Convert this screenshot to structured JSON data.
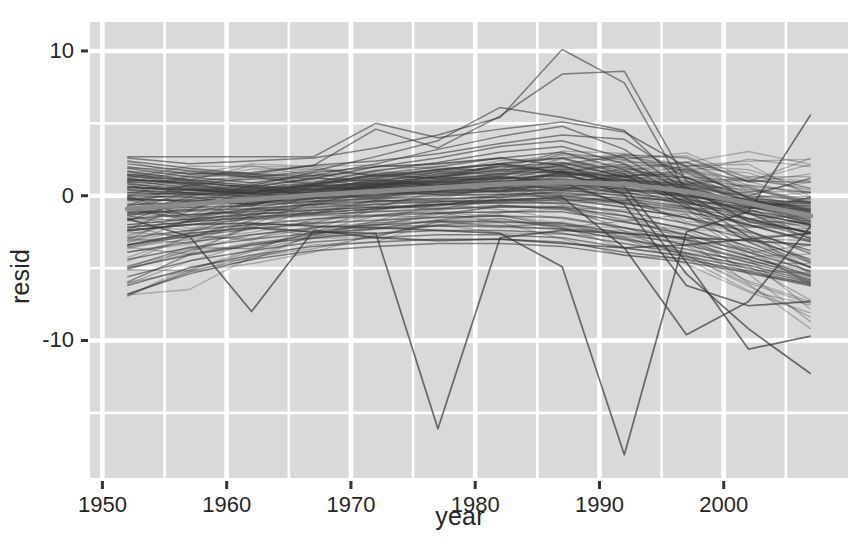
{
  "chart_data": {
    "type": "line",
    "title": "",
    "subtitle": "",
    "xlabel": "year",
    "ylabel": "resid",
    "xlim": [
      1949.0,
      2010.0
    ],
    "ylim": [
      -19.5,
      12.0
    ],
    "xticks": [
      1950,
      1960,
      1970,
      1980,
      1990,
      2000
    ],
    "xtick_labels": [
      "1950",
      "1960",
      "1970",
      "1980",
      "1990",
      "2000"
    ],
    "yticks": [
      10,
      0,
      -10
    ],
    "ytick_labels": [
      "10",
      "0",
      "-10"
    ],
    "minor_yticks": [
      5,
      -5,
      -15
    ],
    "minor_xticks": [
      1955,
      1965,
      1975,
      1985,
      1995,
      2005
    ],
    "grid": true,
    "grid_color": "#ffffff",
    "panel_background": "#d9d9d9",
    "legend_position": "none",
    "line_color": "#3a3a3a",
    "smooth_line_color": "#8c8c8c",
    "x_sample_years": [
      1952,
      1957,
      1962,
      1967,
      1972,
      1977,
      1982,
      1987,
      1992,
      1997,
      2002,
      2007
    ],
    "n_series": 142,
    "series": [
      {
        "name": "loess-smooth",
        "is_smooth": true,
        "values": [
          -0.9,
          -0.6,
          -0.25,
          0.05,
          0.3,
          0.55,
          0.8,
          0.95,
          0.8,
          0.3,
          -0.5,
          -1.4
        ]
      },
      {
        "name": "s1",
        "values": [
          2.7,
          2.7,
          2.7,
          2.7,
          5.0,
          4.0,
          4.6,
          5.1,
          4.4,
          2.0,
          -0.2,
          -1.4
        ]
      },
      {
        "name": "s2",
        "values": [
          2.6,
          2.2,
          2.4,
          2.6,
          3.3,
          4.2,
          5.4,
          10.1,
          7.8,
          0.2,
          -1.2,
          -2.0
        ]
      },
      {
        "name": "s3",
        "values": [
          2.4,
          1.9,
          1.5,
          2.1,
          4.6,
          3.3,
          5.5,
          8.4,
          8.6,
          1.0,
          -0.4,
          -1.1
        ]
      },
      {
        "name": "s4",
        "values": [
          2.2,
          1.7,
          1.3,
          1.7,
          2.7,
          3.8,
          6.1,
          5.4,
          4.5,
          0.6,
          -1.8,
          -2.5
        ]
      },
      {
        "name": "s5",
        "values": [
          2.0,
          1.5,
          1.6,
          2.1,
          2.4,
          2.9,
          3.6,
          4.2,
          3.9,
          1.2,
          0.0,
          1.2
        ]
      },
      {
        "name": "s6",
        "values": [
          1.9,
          1.3,
          0.9,
          1.4,
          2.2,
          3.2,
          4.1,
          4.8,
          3.2,
          0.4,
          -1.2,
          -3.0
        ]
      },
      {
        "name": "s7",
        "values": [
          1.7,
          1.1,
          0.7,
          1.6,
          2.0,
          2.6,
          3.4,
          3.8,
          2.6,
          0.2,
          -2.4,
          -4.0
        ]
      },
      {
        "name": "s8",
        "values": [
          1.5,
          1.0,
          0.5,
          0.9,
          1.7,
          2.3,
          3.0,
          3.4,
          2.2,
          -0.2,
          -2.8,
          -4.6
        ]
      },
      {
        "name": "s9",
        "values": [
          1.4,
          0.8,
          0.4,
          0.8,
          1.5,
          2.0,
          2.6,
          3.0,
          1.8,
          -0.6,
          -3.2,
          -5.0
        ]
      },
      {
        "name": "s10",
        "values": [
          1.2,
          0.7,
          0.3,
          0.7,
          1.2,
          1.8,
          2.2,
          2.6,
          1.5,
          -0.8,
          -2.0,
          -3.1
        ]
      },
      {
        "name": "s11",
        "values": [
          1.0,
          0.6,
          0.2,
          0.6,
          1.0,
          1.5,
          2.0,
          2.3,
          1.3,
          -0.4,
          -1.6,
          -2.6
        ]
      },
      {
        "name": "s12",
        "values": [
          0.8,
          0.5,
          0.1,
          0.5,
          0.9,
          1.3,
          1.8,
          2.0,
          1.1,
          -0.2,
          -1.0,
          -1.8
        ]
      },
      {
        "name": "s13",
        "values": [
          0.6,
          0.4,
          0.1,
          0.4,
          0.8,
          1.1,
          1.5,
          1.7,
          0.9,
          0.0,
          -0.6,
          -1.2
        ]
      },
      {
        "name": "s14",
        "values": [
          0.4,
          0.2,
          0.0,
          0.3,
          0.6,
          0.9,
          1.2,
          1.4,
          0.7,
          0.1,
          -0.3,
          -0.8
        ]
      },
      {
        "name": "s15",
        "values": [
          0.2,
          0.1,
          -0.1,
          0.2,
          0.5,
          0.7,
          1.0,
          1.1,
          0.5,
          0.0,
          -0.2,
          -0.5
        ]
      },
      {
        "name": "s16",
        "values": [
          0.0,
          -0.1,
          -0.2,
          0.1,
          0.3,
          0.5,
          0.8,
          0.9,
          0.4,
          -0.1,
          -0.4,
          -0.9
        ]
      },
      {
        "name": "s17",
        "values": [
          -0.3,
          -0.3,
          -0.4,
          -0.1,
          0.1,
          0.3,
          0.5,
          0.6,
          0.2,
          -0.3,
          -0.8,
          -1.5
        ]
      },
      {
        "name": "s18",
        "values": [
          -0.6,
          -0.5,
          -0.5,
          -0.2,
          0.0,
          0.2,
          0.3,
          0.4,
          0.0,
          -0.5,
          -1.2,
          -2.0
        ]
      },
      {
        "name": "s19",
        "values": [
          -0.9,
          -0.8,
          -0.7,
          -0.4,
          -0.2,
          0.0,
          0.1,
          0.2,
          -0.2,
          -0.8,
          -1.6,
          -2.6
        ]
      },
      {
        "name": "s20",
        "values": [
          -1.2,
          -1.0,
          -0.9,
          -0.6,
          -0.4,
          -0.2,
          -0.1,
          0.0,
          -0.5,
          -1.1,
          -2.0,
          -3.2
        ]
      },
      {
        "name": "s21",
        "values": [
          -1.6,
          -1.3,
          -1.1,
          -0.8,
          -0.6,
          -0.4,
          -0.3,
          -0.2,
          -0.8,
          -1.5,
          -2.5,
          -3.8
        ]
      },
      {
        "name": "s22",
        "values": [
          -2.0,
          -1.6,
          -1.3,
          -1.0,
          -0.8,
          -0.6,
          -0.5,
          -0.5,
          -1.1,
          -1.9,
          -3.0,
          -4.4
        ]
      },
      {
        "name": "s23",
        "values": [
          -2.4,
          -2.0,
          -1.6,
          -1.3,
          -1.1,
          -0.9,
          -0.8,
          -0.8,
          -1.4,
          -2.3,
          -3.5,
          -4.9
        ]
      },
      {
        "name": "s24",
        "values": [
          -2.9,
          -2.4,
          -2.0,
          -1.6,
          -1.4,
          -1.2,
          -1.1,
          -1.1,
          -1.8,
          -2.7,
          -3.9,
          -5.2
        ]
      },
      {
        "name": "s25",
        "values": [
          -3.4,
          -2.8,
          -2.3,
          -1.9,
          -1.7,
          -1.5,
          -1.4,
          -1.5,
          -2.2,
          -3.0,
          -4.2,
          -5.5
        ]
      },
      {
        "name": "s26",
        "values": [
          -3.9,
          -3.2,
          -2.7,
          -2.2,
          -2.0,
          -1.8,
          -1.8,
          -1.9,
          -2.6,
          -3.4,
          -4.4,
          -5.6
        ]
      },
      {
        "name": "s27",
        "values": [
          -4.4,
          -3.6,
          -3.0,
          -2.6,
          -2.3,
          -2.1,
          -2.1,
          -2.3,
          -3.0,
          -3.7,
          -4.6,
          -5.8
        ]
      },
      {
        "name": "s28",
        "values": [
          -5.0,
          -4.1,
          -3.4,
          -2.9,
          -2.6,
          -2.4,
          -2.4,
          -2.6,
          -3.3,
          -4.0,
          -4.8,
          -5.9
        ]
      },
      {
        "name": "s29",
        "values": [
          -5.6,
          -4.5,
          -3.8,
          -3.2,
          -2.9,
          -2.7,
          -2.7,
          -2.9,
          -3.6,
          -4.2,
          -5.0,
          -6.0
        ]
      },
      {
        "name": "s30",
        "values": [
          -6.2,
          -5.0,
          -4.1,
          -3.5,
          -3.2,
          -3.0,
          -3.0,
          -3.2,
          -3.9,
          -4.4,
          -5.2,
          -6.1
        ]
      },
      {
        "name": "s31",
        "values": [
          -6.8,
          -5.4,
          -4.4,
          -3.8,
          -3.5,
          -3.3,
          -3.3,
          -3.5,
          -4.1,
          -4.6,
          -5.3,
          -6.2
        ]
      },
      {
        "name": "outlier-1977-dip",
        "values": [
          -3.4,
          -2.6,
          -2.2,
          -2.5,
          -2.6,
          -16.1,
          -2.9,
          -2.4,
          -2.6,
          -2.9,
          -3.1,
          -3.4
        ]
      },
      {
        "name": "outlier-1992-dip",
        "values": [
          -2.4,
          -2.0,
          -1.9,
          -2.1,
          -2.2,
          -2.4,
          -2.6,
          -4.9,
          -17.9,
          -2.5,
          -1.1,
          5.6
        ]
      },
      {
        "name": "outlier-1962-dip",
        "values": [
          -1.6,
          -2.8,
          -8.0,
          -2.4,
          -2.9,
          -3.1,
          -3.0,
          -3.3,
          -3.6,
          -3.4,
          -3.0,
          -2.6
        ]
      },
      {
        "name": "outlier-late-drop-a",
        "values": [
          1.1,
          0.9,
          0.6,
          1.2,
          2.0,
          2.2,
          2.6,
          2.1,
          0.6,
          -4.6,
          -10.6,
          -9.7
        ]
      },
      {
        "name": "outlier-late-drop-b",
        "values": [
          0.6,
          0.4,
          0.2,
          0.8,
          1.4,
          1.8,
          2.2,
          1.6,
          0.1,
          -5.4,
          -9.2,
          -12.3
        ]
      },
      {
        "name": "outlier-late-drop-c",
        "values": [
          -0.2,
          -0.4,
          -0.6,
          0.1,
          0.7,
          1.0,
          1.3,
          0.9,
          -0.6,
          -6.2,
          -7.6,
          -7.3
        ]
      },
      {
        "name": "outlier-late-rise",
        "values": [
          -2.2,
          -1.8,
          -1.5,
          -1.2,
          -0.9,
          -0.6,
          -0.3,
          -0.1,
          -3.6,
          -9.6,
          -7.3,
          -2.1
        ]
      }
    ]
  },
  "axis": {
    "y_title": "resid",
    "x_title": "year"
  }
}
